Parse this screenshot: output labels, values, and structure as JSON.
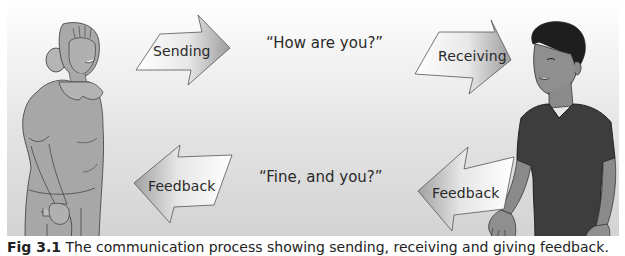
{
  "diagram": {
    "type": "communication-process",
    "arrows": [
      {
        "id": "sending",
        "label": "Sending",
        "direction": "right",
        "row": "top"
      },
      {
        "id": "receiving",
        "label": "Receiving",
        "direction": "right",
        "row": "top"
      },
      {
        "id": "feedback-left",
        "label": "Feedback",
        "direction": "left",
        "row": "bottom"
      },
      {
        "id": "feedback-right",
        "label": "Feedback",
        "direction": "left",
        "row": "bottom"
      }
    ],
    "messages": {
      "top": "“How are you?”",
      "bottom": "“Fine, and you?”"
    },
    "figures": {
      "left": "older woman with cane (sender)",
      "right": "young man in dark t-shirt (receiver)"
    }
  },
  "caption": {
    "label": "Fig 3.1",
    "text": "The communication process showing sending, receiving and giving feedback."
  },
  "colors": {
    "background_top": "#ffffff",
    "background_bottom": "#d3d3d3",
    "woman_fill": "#a8a8a8",
    "man_shirt": "#3c3c3c",
    "skin_dark": "#8a8a8a",
    "outline": "#3a3a3a"
  }
}
